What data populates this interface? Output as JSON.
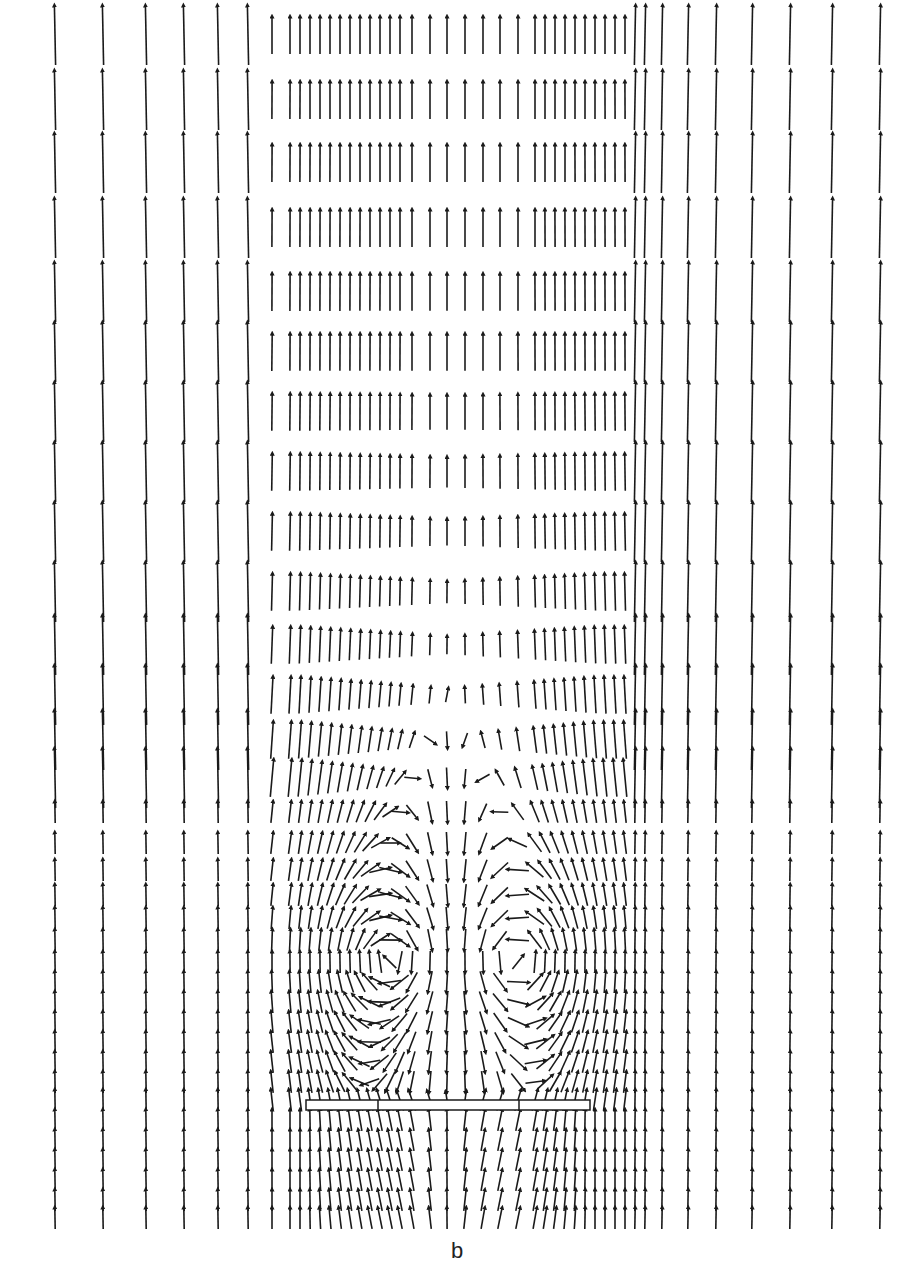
{
  "figure": {
    "panel_label": "b",
    "colors": {
      "arrow": "#1a1a1a",
      "background": "#ffffff",
      "plate": "#1a1a1a"
    }
  },
  "field": {
    "columns_x": [
      55,
      103,
      146,
      184,
      218,
      248,
      272,
      290,
      300,
      310,
      320,
      330,
      340,
      350,
      360,
      370,
      380,
      390,
      400,
      412,
      430,
      447,
      465,
      483,
      500,
      518,
      535,
      545,
      555,
      565,
      575,
      585,
      595,
      605,
      615,
      625,
      635,
      645,
      662,
      688,
      716,
      752,
      790,
      832,
      880
    ],
    "rows_y": [
      35,
      100,
      163,
      228,
      292,
      352,
      412,
      472,
      532,
      592,
      645,
      695,
      740,
      778,
      812,
      843,
      870,
      895,
      918,
      940,
      962,
      982,
      1002,
      1022,
      1042,
      1062,
      1082,
      1100,
      1120,
      1140,
      1160,
      1180,
      1200,
      1218
    ],
    "plate": {
      "x1": 306,
      "x2": 590,
      "y": 1100,
      "height": 10,
      "dividers_x": [
        378,
        519
      ]
    },
    "vortex_left": {
      "cx": 400,
      "cy": 960,
      "strength": 1.0
    },
    "vortex_right": {
      "cx": 510,
      "cy": 960,
      "strength": -1.0
    },
    "max_arrow_len": 42
  }
}
